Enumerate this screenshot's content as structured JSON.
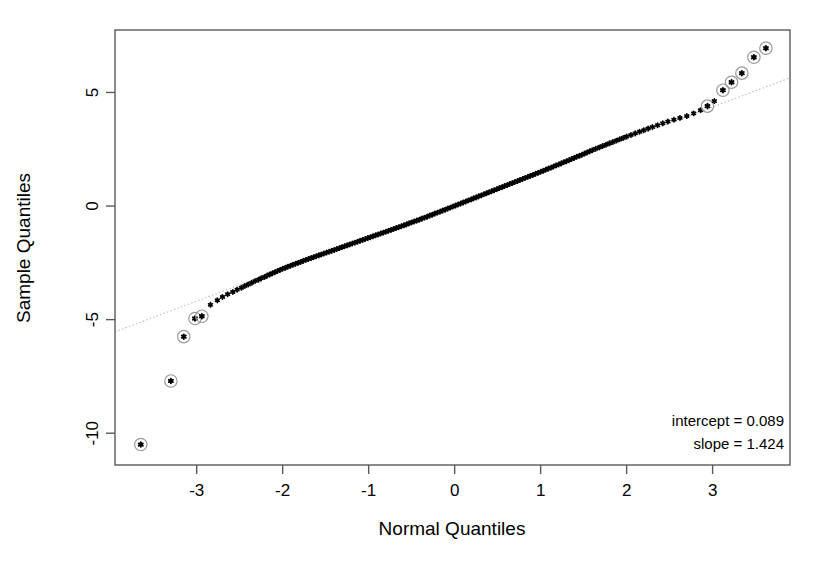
{
  "figure": {
    "background": "#ffffff",
    "frame_color": "#5a5a5a",
    "point_color": "#000000",
    "refline_color": "#bdbdbd",
    "outlier_ring_color": "#9a9a9a"
  },
  "annotations": {
    "intercept_text": "intercept = 0.089",
    "slope_text": "slope = 1.424"
  },
  "axes": {
    "xlabel": "Normal Quantiles",
    "ylabel": "Sample Quantiles",
    "xticks": [
      "-3",
      "-2",
      "-1",
      "0",
      "1",
      "2",
      "3"
    ],
    "yticks": [
      "5",
      "0",
      "-5",
      "-10"
    ]
  },
  "chart_data": {
    "type": "scatter",
    "title": "",
    "subtitle": "",
    "xlabel": "Normal Quantiles",
    "ylabel": "Sample Quantiles",
    "xlim": [
      -3.95,
      3.9
    ],
    "ylim": [
      -11.4,
      7.75
    ],
    "xticks": [
      -3,
      -2,
      -1,
      0,
      1,
      2,
      3
    ],
    "yticks": [
      5,
      0,
      -5,
      -10
    ],
    "grid": false,
    "legend": "none",
    "reference_line": {
      "name": "qq-reference-line",
      "intercept": 0.089,
      "slope": 1.424,
      "style": "dotted",
      "color": "#bdbdbd"
    },
    "fit": {
      "intercept": 0.089,
      "slope": 1.424
    },
    "marker": "asterisk",
    "outlier_marker": "asterisk-in-circle",
    "series": [
      {
        "name": "Sample quantiles vs normal quantiles",
        "x": [
          -3.65,
          -3.3,
          -3.15,
          -3.02,
          -2.94,
          -2.84,
          -2.76,
          -2.7,
          -2.64,
          -2.58,
          -2.53,
          -2.48,
          -2.44,
          -2.4,
          -2.36,
          -2.32,
          -2.28,
          -2.25,
          -2.21,
          -2.18,
          -2.15,
          -2.12,
          -2.09,
          -2.06,
          -2.03,
          -2.0,
          -1.97,
          -1.94,
          -1.91,
          -1.88,
          -1.85,
          -1.82,
          -1.79,
          -1.76,
          -1.73,
          -1.7,
          -1.67,
          -1.64,
          -1.61,
          -1.58,
          -1.55,
          -1.52,
          -1.49,
          -1.46,
          -1.43,
          -1.4,
          -1.37,
          -1.34,
          -1.31,
          -1.28,
          -1.25,
          -1.22,
          -1.19,
          -1.16,
          -1.13,
          -1.1,
          -1.07,
          -1.04,
          -1.01,
          -0.98,
          -0.95,
          -0.92,
          -0.89,
          -0.86,
          -0.83,
          -0.8,
          -0.77,
          -0.74,
          -0.71,
          -0.68,
          -0.65,
          -0.62,
          -0.59,
          -0.56,
          -0.53,
          -0.5,
          -0.47,
          -0.44,
          -0.41,
          -0.38,
          -0.35,
          -0.32,
          -0.29,
          -0.26,
          -0.23,
          -0.2,
          -0.17,
          -0.14,
          -0.11,
          -0.08,
          -0.05,
          -0.02,
          0.01,
          0.04,
          0.07,
          0.1,
          0.13,
          0.16,
          0.19,
          0.22,
          0.25,
          0.28,
          0.31,
          0.34,
          0.37,
          0.4,
          0.43,
          0.46,
          0.49,
          0.52,
          0.55,
          0.58,
          0.61,
          0.64,
          0.67,
          0.7,
          0.73,
          0.76,
          0.79,
          0.82,
          0.85,
          0.88,
          0.91,
          0.94,
          0.97,
          1.0,
          1.03,
          1.06,
          1.09,
          1.12,
          1.15,
          1.18,
          1.21,
          1.24,
          1.27,
          1.3,
          1.33,
          1.36,
          1.39,
          1.42,
          1.45,
          1.48,
          1.51,
          1.54,
          1.57,
          1.6,
          1.64,
          1.68,
          1.72,
          1.76,
          1.8,
          1.84,
          1.88,
          1.92,
          1.96,
          2.0,
          2.05,
          2.1,
          2.15,
          2.2,
          2.25,
          2.3,
          2.36,
          2.42,
          2.48,
          2.55,
          2.62,
          2.7,
          2.78,
          2.86,
          2.94,
          3.02,
          3.12,
          3.22,
          3.34,
          3.48,
          3.62
        ],
        "y": [
          -10.5,
          -7.7,
          -5.75,
          -4.95,
          -4.85,
          -4.35,
          -4.15,
          -4.0,
          -3.88,
          -3.78,
          -3.68,
          -3.6,
          -3.52,
          -3.45,
          -3.38,
          -3.3,
          -3.24,
          -3.18,
          -3.12,
          -3.06,
          -3.01,
          -2.96,
          -2.91,
          -2.86,
          -2.81,
          -2.76,
          -2.72,
          -2.67,
          -2.63,
          -2.58,
          -2.54,
          -2.5,
          -2.46,
          -2.41,
          -2.37,
          -2.33,
          -2.29,
          -2.25,
          -2.21,
          -2.17,
          -2.13,
          -2.09,
          -2.05,
          -2.01,
          -1.97,
          -1.93,
          -1.89,
          -1.85,
          -1.81,
          -1.77,
          -1.73,
          -1.69,
          -1.65,
          -1.61,
          -1.57,
          -1.53,
          -1.49,
          -1.45,
          -1.41,
          -1.37,
          -1.33,
          -1.29,
          -1.25,
          -1.21,
          -1.17,
          -1.13,
          -1.09,
          -1.05,
          -1.01,
          -0.97,
          -0.93,
          -0.89,
          -0.85,
          -0.81,
          -0.76,
          -0.72,
          -0.68,
          -0.64,
          -0.6,
          -0.55,
          -0.51,
          -0.47,
          -0.42,
          -0.38,
          -0.33,
          -0.29,
          -0.25,
          -0.2,
          -0.16,
          -0.11,
          -0.07,
          -0.02,
          0.02,
          0.07,
          0.11,
          0.16,
          0.2,
          0.25,
          0.29,
          0.34,
          0.38,
          0.43,
          0.47,
          0.52,
          0.56,
          0.61,
          0.65,
          0.7,
          0.74,
          0.79,
          0.83,
          0.88,
          0.92,
          0.97,
          1.01,
          1.06,
          1.1,
          1.15,
          1.19,
          1.24,
          1.28,
          1.33,
          1.37,
          1.42,
          1.46,
          1.51,
          1.55,
          1.6,
          1.65,
          1.69,
          1.74,
          1.79,
          1.83,
          1.88,
          1.93,
          1.97,
          2.02,
          2.07,
          2.12,
          2.17,
          2.21,
          2.26,
          2.31,
          2.36,
          2.41,
          2.46,
          2.52,
          2.58,
          2.64,
          2.7,
          2.76,
          2.82,
          2.88,
          2.94,
          3.0,
          3.06,
          3.13,
          3.2,
          3.27,
          3.34,
          3.41,
          3.48,
          3.56,
          3.64,
          3.72,
          3.8,
          3.88,
          3.96,
          4.08,
          4.22,
          4.4,
          4.62,
          5.1,
          5.45,
          5.85,
          6.55,
          6.95
        ],
        "outlier_indices": [
          0,
          1,
          2,
          3,
          4,
          170,
          172,
          173,
          174,
          175,
          176
        ]
      }
    ]
  }
}
